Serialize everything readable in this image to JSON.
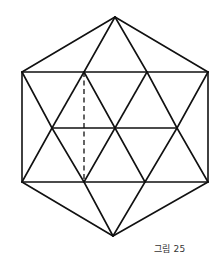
{
  "figure": {
    "caption": "그림 25",
    "line_color": "#111111",
    "vertices": {
      "A": "top-apex",
      "B": "upper-left",
      "C": "upper-inner-left",
      "D": "upper-inner-right",
      "E": "upper-right",
      "F": "mid-left",
      "G": "mid-center",
      "H": "mid-right",
      "I": "lower-left",
      "J": "lower-inner-left",
      "K": "lower-inner-right",
      "L": "lower-right",
      "M": "bottom-apex"
    },
    "edges": [
      {
        "from": "A",
        "to": "B",
        "style": "solid"
      },
      {
        "from": "A",
        "to": "C",
        "style": "solid"
      },
      {
        "from": "A",
        "to": "D",
        "style": "solid"
      },
      {
        "from": "A",
        "to": "E",
        "style": "solid"
      },
      {
        "from": "B",
        "to": "E",
        "style": "solid"
      },
      {
        "from": "B",
        "to": "I",
        "style": "solid"
      },
      {
        "from": "E",
        "to": "L",
        "style": "solid"
      },
      {
        "from": "B",
        "to": "F",
        "style": "solid"
      },
      {
        "from": "C",
        "to": "F",
        "style": "solid"
      },
      {
        "from": "C",
        "to": "G",
        "style": "solid"
      },
      {
        "from": "D",
        "to": "G",
        "style": "solid"
      },
      {
        "from": "D",
        "to": "H",
        "style": "solid"
      },
      {
        "from": "E",
        "to": "H",
        "style": "solid"
      },
      {
        "from": "F",
        "to": "H",
        "style": "solid"
      },
      {
        "from": "F",
        "to": "I",
        "style": "solid"
      },
      {
        "from": "F",
        "to": "J",
        "style": "solid"
      },
      {
        "from": "G",
        "to": "J",
        "style": "solid"
      },
      {
        "from": "G",
        "to": "K",
        "style": "solid"
      },
      {
        "from": "H",
        "to": "K",
        "style": "solid"
      },
      {
        "from": "H",
        "to": "L",
        "style": "solid"
      },
      {
        "from": "I",
        "to": "L",
        "style": "solid"
      },
      {
        "from": "I",
        "to": "M",
        "style": "solid"
      },
      {
        "from": "J",
        "to": "M",
        "style": "solid"
      },
      {
        "from": "K",
        "to": "M",
        "style": "solid"
      },
      {
        "from": "L",
        "to": "M",
        "style": "solid"
      },
      {
        "from": "C",
        "to": "J",
        "style": "dashed"
      }
    ]
  }
}
